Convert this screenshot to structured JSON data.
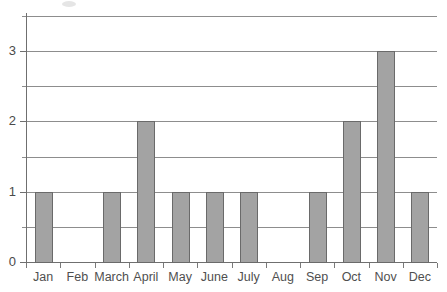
{
  "chart_data": {
    "type": "bar",
    "title": "",
    "subtitle": "",
    "xlabel": "",
    "ylabel": "",
    "categories": [
      "Jan",
      "Feb",
      "March",
      "April",
      "May",
      "June",
      "July",
      "Aug",
      "Sep",
      "Oct",
      "Nov",
      "Dec"
    ],
    "values": [
      1,
      0,
      1,
      2,
      1,
      1,
      1,
      0,
      1,
      2,
      3,
      1
    ],
    "ylim": [
      0,
      3.5
    ],
    "y_tick_labels": [
      "0",
      "1",
      "2",
      "3"
    ],
    "y_tick_values": [
      0,
      1,
      2,
      3
    ],
    "gridline_values": [
      0.5,
      1,
      1.5,
      2,
      2.5,
      3,
      3.5
    ],
    "grid": true,
    "legend": false,
    "legend_position": "none",
    "bar_color": "#a3a3a3",
    "bar_edge_color": "#6a6a6a",
    "gridline_color": "#8d8d8d",
    "axis_color": "#6f6f6f",
    "label_color": "#4f4f4f"
  },
  "plot_geometry": {
    "left": 26,
    "right": 437,
    "top": 16,
    "bottom": 262,
    "bar_width": 17
  }
}
